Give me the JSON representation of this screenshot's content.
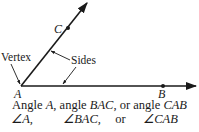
{
  "diagram": {
    "points": {
      "vertex": {
        "label": "A",
        "x": 21,
        "y": 86
      },
      "c": {
        "label": "C",
        "x": 68,
        "y": 28
      },
      "b": {
        "label": "B",
        "x": 163,
        "y": 86
      }
    },
    "labels": {
      "vertex": "Vertex",
      "sides": "Sides"
    },
    "caption": {
      "line1": {
        "p1": "Angle ",
        "a": "A",
        "p2": ", angle ",
        "bac": "BAC",
        "p3": ", or angle ",
        "cab": "CAB"
      },
      "line2": {
        "s1": "∠A,",
        "s2": "∠BAC,",
        "or": "or",
        "s3": "∠CAB"
      }
    },
    "colors": {
      "ink": "#1a1a1a",
      "background": "#ffffff"
    }
  }
}
